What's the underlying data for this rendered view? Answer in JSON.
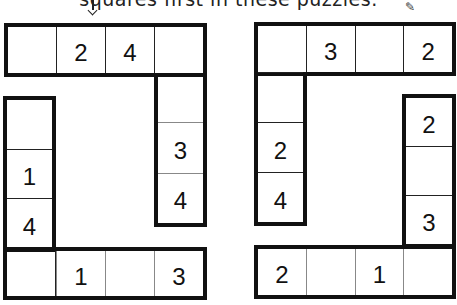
{
  "header": {
    "text": "squares first in these puzzles."
  },
  "icons": {
    "pencil": "pencil-icon"
  },
  "puzzles": [
    {
      "top_row": [
        "",
        "2",
        "4",
        ""
      ],
      "right_column": [
        "",
        "3",
        "4"
      ],
      "left_column": [
        "",
        "1",
        "4"
      ],
      "bottom_row": [
        "",
        "1",
        "",
        "3"
      ]
    },
    {
      "top_row": [
        "",
        "3",
        "",
        "2"
      ],
      "left_column": [
        "",
        "2",
        "4"
      ],
      "right_column": [
        "2",
        "",
        "3"
      ],
      "bottom_row": [
        "2",
        "",
        "1",
        ""
      ]
    }
  ]
}
